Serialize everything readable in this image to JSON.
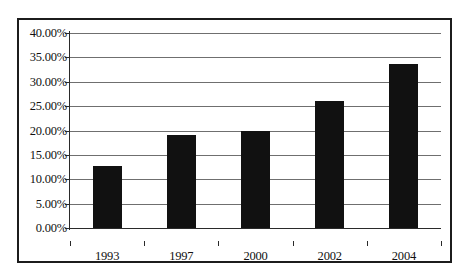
{
  "chart_data": {
    "type": "bar",
    "title": "",
    "subtitle": "",
    "xlabel": "",
    "ylabel": "",
    "categories": [
      "1993",
      "1997",
      "2000",
      "2002",
      "2004"
    ],
    "values": [
      12.7,
      19.0,
      20.0,
      26.0,
      33.7
    ],
    "value_labels": [
      "12.70%",
      "19.00%",
      "20.00%",
      "26.00%",
      "33.70%"
    ],
    "ylim": [
      0,
      40
    ],
    "ytick_values": [
      0,
      5,
      10,
      15,
      20,
      25,
      30,
      35,
      40
    ],
    "ytick_labels": [
      "0.00%",
      "5.00%",
      "10.00%",
      "15.00%",
      "20.00%",
      "25.00%",
      "30.00%",
      "35.00%",
      "40.00%"
    ],
    "grid": true,
    "grid_axis": "y",
    "legend": false,
    "legend_position": "none",
    "series": [
      {
        "name": "",
        "values": [
          12.7,
          19.0,
          20.0,
          26.0,
          33.7
        ]
      }
    ],
    "colors": {
      "bar": "#111111",
      "gridline": "#6f6f6f",
      "axis": "#2a2a2a",
      "border": "#1c1c1c",
      "background": "#ffffff",
      "text": "#111111"
    }
  }
}
